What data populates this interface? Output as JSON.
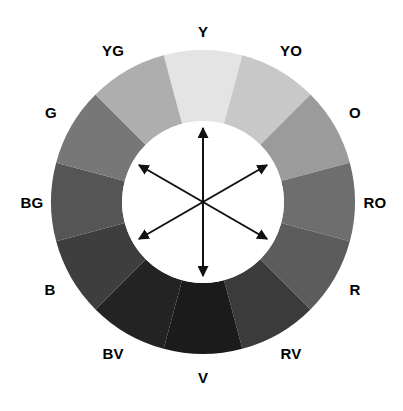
{
  "figure": {
    "background_color": "#ffffff",
    "geometry": {
      "center_x": 203,
      "center_y": 202,
      "outer_radius": 152,
      "inner_radius": 81,
      "segment_count": 12,
      "segment_span_degrees": 30,
      "first_segment_center_angle_degrees": 0
    },
    "hub": {
      "fill_color": "#ffffff",
      "arrow_color": "#111111",
      "arrow_count": 3,
      "arrow_style": "double-headed",
      "arrow_angles_degrees": [
        0,
        60,
        120
      ],
      "arrow_length_radius": 74
    },
    "label_ring_radius": 174,
    "label_color": "#000000"
  },
  "chart_data": {
    "type": "pie",
    "categories": [
      "Y",
      "YO",
      "O",
      "RO",
      "R",
      "RV",
      "V",
      "BV",
      "B",
      "BG",
      "G",
      "YG"
    ],
    "values": [
      30,
      30,
      30,
      30,
      30,
      30,
      30,
      30,
      30,
      30,
      30,
      30
    ],
    "legend": "none",
    "grid": false,
    "segments": [
      {
        "label": "Y",
        "name": "Yellow",
        "angle": 0,
        "color": "#e4e4e4",
        "label_x": 203,
        "label_y": 31
      },
      {
        "label": "YO",
        "name": "Yellow-Orange",
        "angle": 30,
        "color": "#c8c8c8",
        "label_x": 291,
        "label_y": 50
      },
      {
        "label": "O",
        "name": "Orange",
        "angle": 60,
        "color": "#9b9b9b",
        "label_x": 355,
        "label_y": 112
      },
      {
        "label": "RO",
        "name": "Red-Orange",
        "angle": 90,
        "color": "#6e6e6e",
        "label_x": 375,
        "label_y": 202
      },
      {
        "label": "R",
        "name": "Red",
        "angle": 120,
        "color": "#5c5c5c",
        "label_x": 355,
        "label_y": 289
      },
      {
        "label": "RV",
        "name": "Red-Violet",
        "angle": 150,
        "color": "#3b3b3b",
        "label_x": 291,
        "label_y": 353
      },
      {
        "label": "V",
        "name": "Violet",
        "angle": 180,
        "color": "#1b1b1b",
        "label_x": 203,
        "label_y": 377
      },
      {
        "label": "BV",
        "name": "Blue-Violet",
        "angle": 210,
        "color": "#232323",
        "label_x": 113,
        "label_y": 353
      },
      {
        "label": "B",
        "name": "Blue",
        "angle": 240,
        "color": "#3e3e3e",
        "label_x": 50,
        "label_y": 289
      },
      {
        "label": "BG",
        "name": "Blue-Green",
        "angle": 270,
        "color": "#555555",
        "label_x": 32,
        "label_y": 202
      },
      {
        "label": "G",
        "name": "Green",
        "angle": 300,
        "color": "#777777",
        "label_x": 51,
        "label_y": 112
      },
      {
        "label": "YG",
        "name": "Yellow-Green",
        "angle": 330,
        "color": "#aeaeae",
        "label_x": 113,
        "label_y": 50
      }
    ]
  }
}
